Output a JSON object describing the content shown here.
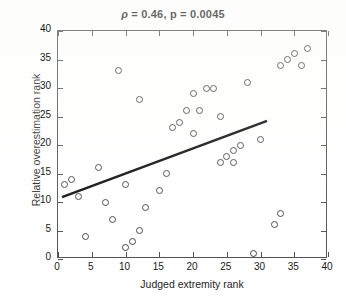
{
  "chart_data": {
    "type": "scatter",
    "title": "ρ = 0.46, p = 0.0045",
    "title_parts": {
      "rho_symbol": "ρ",
      "rho_value": "0.46",
      "p_value": "0.0045",
      "full": "ρ = 0.46, p = 0.0045"
    },
    "xlabel": "Judged extremity rank",
    "ylabel": "Relative overestimation rank",
    "xlim": [
      0,
      40
    ],
    "ylim": [
      0,
      40
    ],
    "xticks": [
      0,
      5,
      10,
      15,
      20,
      25,
      30,
      35,
      40
    ],
    "yticks": [
      0,
      5,
      10,
      15,
      20,
      25,
      30,
      35,
      40
    ],
    "grid": false,
    "legend": false,
    "marker": "open-circle",
    "marker_color": "#3c3c3c",
    "line_color": "#000000",
    "points": [
      {
        "x": 1,
        "y": 13
      },
      {
        "x": 2,
        "y": 14
      },
      {
        "x": 3,
        "y": 11
      },
      {
        "x": 4,
        "y": 4
      },
      {
        "x": 6,
        "y": 16
      },
      {
        "x": 7,
        "y": 10
      },
      {
        "x": 8,
        "y": 7
      },
      {
        "x": 9,
        "y": 33
      },
      {
        "x": 10,
        "y": 2
      },
      {
        "x": 10,
        "y": 13
      },
      {
        "x": 11,
        "y": 3
      },
      {
        "x": 12,
        "y": 28
      },
      {
        "x": 12,
        "y": 5
      },
      {
        "x": 13,
        "y": 9
      },
      {
        "x": 15,
        "y": 12
      },
      {
        "x": 16,
        "y": 15
      },
      {
        "x": 17,
        "y": 23
      },
      {
        "x": 18,
        "y": 24
      },
      {
        "x": 19,
        "y": 26
      },
      {
        "x": 20,
        "y": 29
      },
      {
        "x": 20,
        "y": 22
      },
      {
        "x": 21,
        "y": 26
      },
      {
        "x": 22,
        "y": 30
      },
      {
        "x": 23,
        "y": 30
      },
      {
        "x": 24,
        "y": 25
      },
      {
        "x": 24,
        "y": 17
      },
      {
        "x": 25,
        "y": 18
      },
      {
        "x": 26,
        "y": 19
      },
      {
        "x": 26,
        "y": 17
      },
      {
        "x": 27,
        "y": 20
      },
      {
        "x": 28,
        "y": 31
      },
      {
        "x": 29,
        "y": 1
      },
      {
        "x": 30,
        "y": 21
      },
      {
        "x": 32,
        "y": 6
      },
      {
        "x": 33,
        "y": 8
      },
      {
        "x": 33,
        "y": 34
      },
      {
        "x": 34,
        "y": 35
      },
      {
        "x": 35,
        "y": 36
      },
      {
        "x": 36,
        "y": 34
      },
      {
        "x": 37,
        "y": 37
      }
    ],
    "fit_line": {
      "name": "least-squares fit",
      "x_start": 0.6,
      "y_start": 10.6,
      "x_end": 31.2,
      "y_end": 24.1
    }
  }
}
